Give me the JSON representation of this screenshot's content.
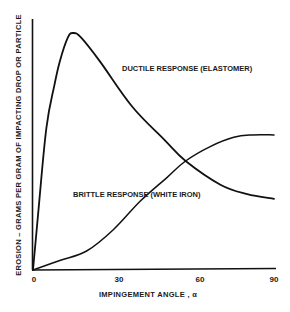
{
  "chart_data": {
    "type": "line",
    "title": "",
    "xlabel": "IMPINGEMENT ANGLE , α",
    "ylabel": "EROSION – GRAMS PER GRAM OF IMPACTING DROP OR PARTICLE",
    "xlim": [
      0,
      90
    ],
    "ylim": [
      0,
      1.0
    ],
    "x_ticks": [
      "0",
      "30",
      "60",
      "90"
    ],
    "y_ticks": [],
    "grid": false,
    "legend": "inline labels",
    "series": [
      {
        "name": "DUCTILE RESPONSE (ELASTOMER)",
        "x": [
          0,
          2,
          5,
          8,
          10,
          13,
          15,
          18,
          25,
          37,
          49,
          57,
          70,
          80,
          90
        ],
        "values": [
          0,
          0.25,
          0.6,
          0.78,
          0.88,
          0.98,
          1.0,
          0.98,
          0.88,
          0.69,
          0.55,
          0.46,
          0.36,
          0.32,
          0.3
        ]
      },
      {
        "name": "BRITTLE RESPONSE (WHITE IRON)",
        "x": [
          0,
          10,
          20,
          30,
          40,
          50,
          57,
          66,
          75,
          82,
          90
        ],
        "values": [
          0,
          0.04,
          0.08,
          0.17,
          0.29,
          0.39,
          0.46,
          0.52,
          0.56,
          0.57,
          0.57
        ]
      }
    ],
    "annotations": [
      {
        "text": "DUCTILE RESPONSE (ELASTOMER)",
        "x": 33,
        "y": 0.85
      },
      {
        "text": "BRITTLE RESPONSE (WHITE IRON)",
        "x": 15,
        "y": 0.32
      }
    ]
  },
  "labels": {
    "ductile": "DUCTILE RESPONSE (ELASTOMER)",
    "brittle": "BRITTLE RESPONSE (WHITE IRON)",
    "xaxis": "IMPINGEMENT ANGLE , α",
    "yaxis": "EROSION – GRAMS PER GRAM OF IMPACTING DROP OR PARTICLE",
    "tick0": "0",
    "tick30": "30",
    "tick60": "60",
    "tick90": "90"
  },
  "style": {
    "line_color": "#111111",
    "background": "#ffffff"
  }
}
